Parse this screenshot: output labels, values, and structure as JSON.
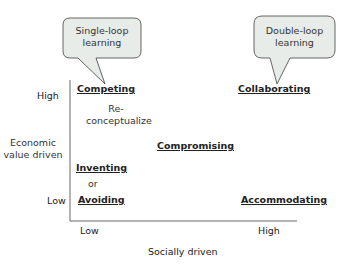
{
  "bubbles": {
    "left": {
      "line1": "Single-loop",
      "line2": "learning"
    },
    "right": {
      "line1": "Double-loop",
      "line2": "learning"
    }
  },
  "axes": {
    "y_title_line1": "Economic",
    "y_title_line2": "value driven",
    "y_high": "High",
    "y_low": "Low",
    "x_low": "Low",
    "x_high": "High",
    "x_title": "Socially driven"
  },
  "quadrants": {
    "competing": "Competing",
    "collaborating": "Collaborating",
    "compromising": "Compromising",
    "inventing": "Inventing",
    "or": "or",
    "avoiding": "Avoiding",
    "accommodating": "Accommodating",
    "reconceptualize_line1": "Re-",
    "reconceptualize_line2": "conceptualize"
  },
  "colors": {
    "bubble_fill": "#e8ece8",
    "bubble_stroke": "#555555",
    "axis": "#555555"
  }
}
